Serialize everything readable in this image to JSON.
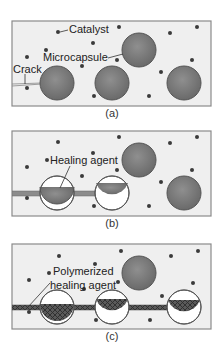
{
  "colors": {
    "matrix": "#eeeeee",
    "frame": "#8a8a8a",
    "capsule": "#7d7d7d",
    "capsule_edge": "#555555",
    "dot": "#3a3a3a",
    "crack": "#8c8c8c",
    "polymer": "#4a4a4a"
  },
  "panels": [
    {
      "caption": "(a)",
      "labels": {
        "catalyst": "Catalyst",
        "microcapsule": "Microcapsule",
        "crack": "Crack"
      }
    },
    {
      "caption": "(b)",
      "labels": {
        "healing_agent": "Healing agent"
      }
    },
    {
      "caption": "(c)",
      "labels": {
        "polymerized_line1": "Polymerized",
        "polymerized_line2": "healing agent"
      }
    }
  ]
}
